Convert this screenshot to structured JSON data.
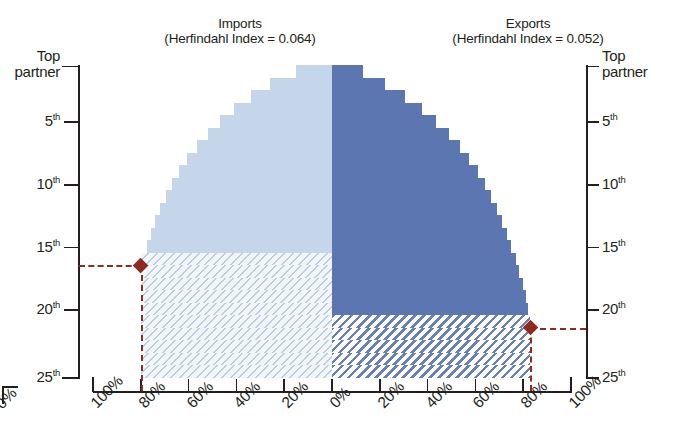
{
  "titles": {
    "imports": "Imports\n(Herfindahl Index = 0.064)",
    "exports": "Exports\n(Herfindahl Index = 0.052)"
  },
  "axes": {
    "y_left_label": "Top\npartner",
    "y_right_label": "Top\npartner",
    "y_ticks": [
      "Top partner",
      "5th",
      "10th",
      "15th",
      "20th",
      "25th"
    ],
    "y_tick_values": [
      1,
      5,
      10,
      15,
      20,
      25
    ],
    "x_ticks_left": [
      "100%",
      "80%",
      "60%",
      "40%",
      "20%",
      "0%"
    ],
    "x_ticks_right": [
      "20%",
      "40%",
      "60%",
      "80%",
      "100%"
    ],
    "cut_off_label": "0%"
  },
  "colors": {
    "imports_fill": "#c5d5ea",
    "exports_fill": "#5b76b0",
    "marker": "#8e2a20",
    "axis": "#231f20",
    "background": "#ffffff"
  },
  "markers": {
    "imports": {
      "rank": "16th",
      "share": "80%",
      "rank_value": 16,
      "share_value": 80
    },
    "exports": {
      "rank": "21st",
      "share": "83%",
      "rank_value": 21,
      "share_value": 83
    }
  },
  "chart_data": {
    "type": "area",
    "subtitle": "Imports (Herfindahl Index = 0.064) vs Exports (Herfindahl Index = 0.052)",
    "xlabel": "Cumulative share of trade",
    "ylabel": "Partner rank",
    "orientation": "horizontal-mirrored",
    "grid": false,
    "legend_position": "none",
    "ylim": [
      1,
      25
    ],
    "xlim_left": [
      0,
      100
    ],
    "xlim_right": [
      0,
      100
    ],
    "y_tick_labels": [
      "Top partner",
      "5th",
      "10th",
      "15th",
      "20th",
      "25th"
    ],
    "x_tick_labels": [
      "100%",
      "80%",
      "60%",
      "40%",
      "20%",
      "0%",
      "20%",
      "40%",
      "60%",
      "80%",
      "100%"
    ],
    "categories": [
      1,
      2,
      3,
      4,
      5,
      6,
      7,
      8,
      9,
      10,
      11,
      12,
      13,
      14,
      15,
      16,
      17,
      18,
      19,
      20,
      21,
      22,
      23,
      24,
      25
    ],
    "series": [
      {
        "name": "Imports",
        "herfindahl_index": 0.064,
        "fill": "#c5d5ea",
        "direction": "left",
        "annotation_rank": 16,
        "annotation_share": 80,
        "values": [
          15,
          26,
          34,
          41,
          47,
          52,
          56.5,
          60.5,
          64,
          67,
          69.5,
          72,
          74,
          75.8,
          77.5,
          80,
          80,
          80,
          80,
          80,
          80,
          80,
          80,
          80,
          80
        ],
        "hatched_from_rank": 16
      },
      {
        "name": "Exports",
        "herfindahl_index": 0.052,
        "fill": "#5b76b0",
        "direction": "right",
        "annotation_rank": 21,
        "annotation_share": 83,
        "values": [
          13,
          22,
          30.5,
          37.5,
          43.5,
          49,
          53.5,
          57.5,
          61,
          64,
          66.5,
          69,
          71.2,
          73.2,
          75,
          76.8,
          78.4,
          80,
          81.2,
          82.2,
          83,
          83,
          83,
          83,
          83
        ],
        "hatched_from_rank": 21
      }
    ],
    "annotations": [
      {
        "series": "Imports",
        "text": "80% of imports come from top 16 partners",
        "rank": 16,
        "share": 80
      },
      {
        "series": "Exports",
        "text": "83% of exports go to top 21 partners",
        "rank": 21,
        "share": 83
      }
    ]
  }
}
